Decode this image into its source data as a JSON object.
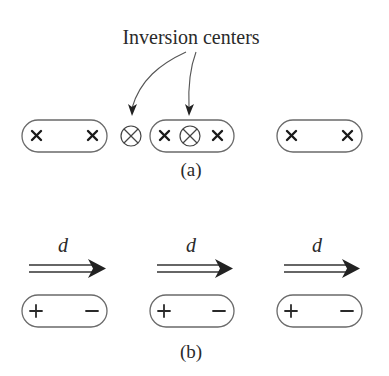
{
  "figure": {
    "panel_a": {
      "title": "Inversion centers",
      "caption": "(a)",
      "molecules": [
        {
          "left_symbol": "×",
          "center_symbol": "",
          "right_symbol": "×"
        },
        {
          "left_symbol": "×",
          "center_symbol": "⊗",
          "right_symbol": "×"
        },
        {
          "left_symbol": "×",
          "center_symbol": "",
          "right_symbol": "×"
        }
      ],
      "free_inversion_center": "⊗",
      "pointer_count": 2
    },
    "panel_b": {
      "caption": "(b)",
      "dipole_label": "d",
      "molecules": [
        {
          "left_symbol": "+",
          "right_symbol": "−",
          "arrow_label": "d"
        },
        {
          "left_symbol": "+",
          "right_symbol": "−",
          "arrow_label": "d"
        },
        {
          "left_symbol": "+",
          "right_symbol": "−",
          "arrow_label": "d"
        }
      ]
    }
  }
}
